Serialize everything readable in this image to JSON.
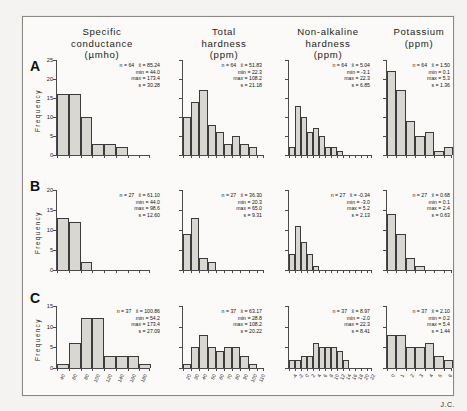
{
  "figure": {
    "credit": "J.C.",
    "row_labels": [
      "A",
      "B",
      "C"
    ],
    "y_axis_title": "Frequency",
    "columns": [
      {
        "title_line1": "Specific",
        "title_line2": "conductance",
        "units": "(µmho)"
      },
      {
        "title_line1": "Total",
        "title_line2": "hardness",
        "units": "(ppm)"
      },
      {
        "title_line1": "Non-alkaline",
        "title_line2": "hardness",
        "units": "(ppm)"
      },
      {
        "title_line1": "Potassium",
        "title_line2": "",
        "units": "(ppm)"
      }
    ]
  },
  "stat_labels": {
    "n": "n =",
    "mean": "x̄ =",
    "min": "min =",
    "max": "max =",
    "sd": "s ="
  },
  "chart_data": [
    {
      "id": "A1",
      "type": "bar",
      "row": "A",
      "title": "Specific conductance (µmho)",
      "xlabel": "",
      "ylabel": "Frequency",
      "ylim": [
        0,
        25
      ],
      "yticks": [
        0,
        5,
        10,
        15,
        20,
        25
      ],
      "ytick_labels": [
        "0",
        "5",
        "10",
        "15",
        "20",
        "25"
      ],
      "grid": false,
      "categories": [
        "40",
        "60",
        "80",
        "100",
        "120",
        "140",
        "160",
        "180"
      ],
      "values": [
        16,
        16,
        10,
        3,
        3,
        2
      ],
      "stats": {
        "n": "64",
        "mean": "85.24",
        "min": "44.0",
        "max": "173.4",
        "sd": "30.28"
      }
    },
    {
      "id": "A2",
      "type": "bar",
      "row": "A",
      "title": "Total hardness (ppm)",
      "xlabel": "",
      "ylabel": "Frequency",
      "ylim": [
        0,
        25
      ],
      "yticks": [
        0,
        5,
        10,
        15,
        20,
        25
      ],
      "ytick_labels": [
        "",
        "",
        "",
        "",
        "",
        ""
      ],
      "grid": false,
      "categories": [
        "20",
        "30",
        "40",
        "50",
        "60",
        "70",
        "80",
        "90",
        "100",
        "110"
      ],
      "values": [
        10,
        14,
        17,
        8,
        6,
        3,
        5,
        3,
        2
      ],
      "stats": {
        "n": "64",
        "mean": "51.83",
        "min": "22.3",
        "max": "108.2",
        "sd": "21.18"
      }
    },
    {
      "id": "A3",
      "type": "bar",
      "row": "A",
      "title": "Non-alkaline hardness (ppm)",
      "xlabel": "",
      "ylabel": "Frequency",
      "ylim": [
        0,
        25
      ],
      "yticks": [
        0,
        5,
        10,
        15,
        20,
        25
      ],
      "ytick_labels": [
        "",
        "",
        "",
        "",
        "",
        ""
      ],
      "grid": false,
      "categories": [
        "-4",
        "-2",
        "0",
        "2",
        "4",
        "6",
        "8",
        "10",
        "12",
        "14",
        "16",
        "18",
        "20",
        "22"
      ],
      "values": [
        2,
        13,
        10,
        6,
        7,
        5,
        2,
        2,
        1
      ],
      "stats": {
        "n": "64",
        "mean": "5.04",
        "min": "-3.1",
        "max": "22.3",
        "sd": "6.85"
      }
    },
    {
      "id": "A4",
      "type": "bar",
      "row": "A",
      "title": "Potassium (ppm)",
      "xlabel": "",
      "ylabel": "Frequency",
      "ylim": [
        0,
        25
      ],
      "yticks": [
        0,
        5,
        10,
        15,
        20,
        25
      ],
      "ytick_labels": [
        "",
        "",
        "",
        "",
        "",
        ""
      ],
      "grid": false,
      "categories": [
        "0",
        "1",
        "2",
        "3",
        "4",
        "5",
        "6"
      ],
      "values": [
        22,
        17,
        9,
        5,
        6,
        1,
        2
      ],
      "stats": {
        "n": "64",
        "mean": "1.50",
        "min": "0.1",
        "max": "5.3",
        "sd": "1.36"
      }
    },
    {
      "id": "B1",
      "type": "bar",
      "row": "B",
      "title": "Specific conductance (µmho)",
      "xlabel": "",
      "ylabel": "Frequency",
      "ylim": [
        0,
        20
      ],
      "yticks": [
        0,
        5,
        10,
        15,
        20
      ],
      "ytick_labels": [
        "0",
        "5",
        "10",
        "15",
        "20"
      ],
      "grid": false,
      "categories": [
        "40",
        "60",
        "80",
        "100",
        "120",
        "140",
        "160",
        "180"
      ],
      "values": [
        13,
        12,
        2
      ],
      "stats": {
        "n": "27",
        "mean": "61.10",
        "min": "44.0",
        "max": "98.6",
        "sd": "12.60"
      }
    },
    {
      "id": "B2",
      "type": "bar",
      "row": "B",
      "title": "Total hardness (ppm)",
      "xlabel": "",
      "ylabel": "Frequency",
      "ylim": [
        0,
        20
      ],
      "yticks": [
        0,
        5,
        10,
        15,
        20
      ],
      "ytick_labels": [
        "",
        "",
        "",
        "",
        ""
      ],
      "grid": false,
      "categories": [
        "20",
        "30",
        "40",
        "50",
        "60",
        "70",
        "80",
        "90",
        "100",
        "110"
      ],
      "values": [
        9,
        13,
        3,
        2
      ],
      "stats": {
        "n": "27",
        "mean": "36.30",
        "min": "20.3",
        "max": "65.0",
        "sd": "9.31"
      }
    },
    {
      "id": "B3",
      "type": "bar",
      "row": "B",
      "title": "Non-alkaline hardness (ppm)",
      "xlabel": "",
      "ylabel": "Frequency",
      "ylim": [
        0,
        20
      ],
      "yticks": [
        0,
        5,
        10,
        15,
        20
      ],
      "ytick_labels": [
        "",
        "",
        "",
        "",
        ""
      ],
      "grid": false,
      "categories": [
        "-4",
        "-2",
        "0",
        "2",
        "4",
        "6",
        "8",
        "10",
        "12",
        "14",
        "16",
        "18",
        "20",
        "22"
      ],
      "values": [
        4,
        11,
        7,
        4,
        1
      ],
      "stats": {
        "n": "27",
        "mean": "-0.34",
        "min": "-3.0",
        "max": "5.2",
        "sd": "2.13"
      }
    },
    {
      "id": "B4",
      "type": "bar",
      "row": "B",
      "title": "Potassium (ppm)",
      "xlabel": "",
      "ylabel": "Frequency",
      "ylim": [
        0,
        20
      ],
      "yticks": [
        0,
        5,
        10,
        15,
        20
      ],
      "ytick_labels": [
        "",
        "",
        "",
        "",
        ""
      ],
      "grid": false,
      "categories": [
        "0",
        "1",
        "2",
        "3",
        "4",
        "5",
        "6"
      ],
      "values": [
        14,
        9,
        3,
        1
      ],
      "stats": {
        "n": "27",
        "mean": "0.68",
        "min": "0.1",
        "max": "2.4",
        "sd": "0.63"
      }
    },
    {
      "id": "C1",
      "type": "bar",
      "row": "C",
      "title": "Specific conductance (µmho)",
      "xlabel": "",
      "ylabel": "Frequency",
      "ylim": [
        0,
        15
      ],
      "yticks": [
        0,
        5,
        10,
        15
      ],
      "ytick_labels": [
        "0",
        "5",
        "10",
        "15"
      ],
      "grid": false,
      "categories": [
        "40",
        "60",
        "80",
        "100",
        "120",
        "140",
        "160",
        "180"
      ],
      "values": [
        1,
        6,
        12,
        12,
        3,
        3,
        3,
        1
      ],
      "stats": {
        "n": "37",
        "mean": "100.86",
        "min": "54.2",
        "max": "173.4",
        "sd": "27.09"
      }
    },
    {
      "id": "C2",
      "type": "bar",
      "row": "C",
      "title": "Total hardness (ppm)",
      "xlabel": "",
      "ylabel": "Frequency",
      "ylim": [
        0,
        15
      ],
      "yticks": [
        0,
        5,
        10,
        15
      ],
      "ytick_labels": [
        "",
        "",
        "",
        ""
      ],
      "grid": false,
      "categories": [
        "20",
        "30",
        "40",
        "50",
        "60",
        "70",
        "80",
        "90",
        "100",
        "110"
      ],
      "values": [
        1,
        5,
        8,
        5,
        4,
        5,
        5,
        3,
        1
      ],
      "stats": {
        "n": "37",
        "mean": "63.17",
        "min": "28.8",
        "max": "108.2",
        "sd": "20.22"
      }
    },
    {
      "id": "C3",
      "type": "bar",
      "row": "C",
      "title": "Non-alkaline hardness (ppm)",
      "xlabel": "",
      "ylabel": "Frequency",
      "ylim": [
        0,
        15
      ],
      "yticks": [
        0,
        5,
        10,
        15
      ],
      "ytick_labels": [
        "",
        "",
        "",
        ""
      ],
      "grid": false,
      "categories": [
        "-4",
        "-2",
        "0",
        "2",
        "4",
        "6",
        "8",
        "10",
        "12",
        "14",
        "16",
        "18",
        "20",
        "22"
      ],
      "values": [
        2,
        2,
        3,
        3,
        6,
        5,
        5,
        5,
        4,
        2
      ],
      "stats": {
        "n": "37",
        "mean": "8.97",
        "min": "-2.0",
        "max": "22.3",
        "sd": "8.41"
      }
    },
    {
      "id": "C4",
      "type": "bar",
      "row": "C",
      "title": "Potassium (ppm)",
      "xlabel": "",
      "ylabel": "Frequency",
      "ylim": [
        0,
        15
      ],
      "yticks": [
        0,
        5,
        10,
        15
      ],
      "ytick_labels": [
        "",
        "",
        "",
        ""
      ],
      "grid": false,
      "categories": [
        "0",
        "1",
        "2",
        "3",
        "4",
        "5",
        "6"
      ],
      "values": [
        8,
        8,
        5,
        5,
        6,
        3,
        2
      ],
      "stats": {
        "n": "37",
        "mean": "2.10",
        "min": "0.2",
        "max": "5.4",
        "sd": "1.44"
      }
    }
  ]
}
